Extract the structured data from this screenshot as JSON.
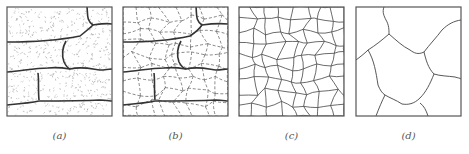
{
  "figure": {
    "panels": [
      {
        "id": "a",
        "label": "(a)",
        "style": "large elongated grains with stippled (dotted) interior"
      },
      {
        "id": "b",
        "label": "(b)",
        "style": "large grains with dashed new small grain boundaries nucleating"
      },
      {
        "id": "c",
        "label": "(c)",
        "style": "fine equiaxed recrystallized grains"
      },
      {
        "id": "d",
        "label": "(d)",
        "style": "coarse grains after grain growth"
      }
    ],
    "colors": {
      "border": "#555555",
      "boundary": "#333333",
      "thin_boundary": "#444444",
      "stipple": "#9a9a9a"
    }
  }
}
